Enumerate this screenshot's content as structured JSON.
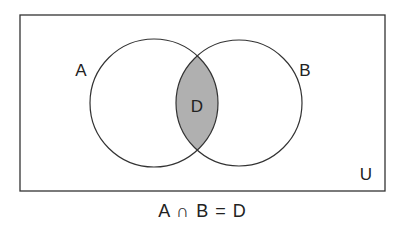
{
  "diagram": {
    "type": "venn",
    "universe": {
      "label": "U",
      "rect": {
        "x": 20,
        "y": 15,
        "width": 365,
        "height": 176
      }
    },
    "sets": [
      {
        "label": "A",
        "cx": 154,
        "cy": 103,
        "r": 64,
        "label_x": 81,
        "label_y": 76
      },
      {
        "label": "B",
        "cx": 239,
        "cy": 103,
        "r": 63,
        "label_x": 305,
        "label_y": 76
      }
    ],
    "intersection": {
      "label": "D",
      "fill": "#b0b0b0",
      "label_x": 197,
      "label_y": 112
    },
    "universe_label_pos": {
      "x": 366,
      "y": 180
    },
    "caption": "A ∩ B = D",
    "colors": {
      "stroke": "#333333",
      "background": "#ffffff",
      "intersection_fill": "#b0b0b0"
    }
  }
}
